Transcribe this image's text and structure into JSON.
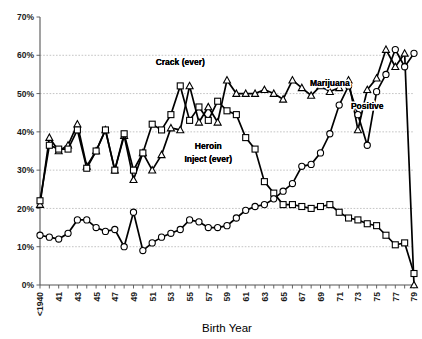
{
  "chart_data": {
    "type": "line",
    "title": "",
    "subtitle": "",
    "xlabel": "Birth Year",
    "ylabel": "",
    "ylim": [
      0,
      70
    ],
    "ytick_labels": [
      "0%",
      "10%",
      "20%",
      "30%",
      "40%",
      "50%",
      "60%",
      "70%"
    ],
    "ytick_values": [
      0,
      10,
      20,
      30,
      40,
      50,
      60,
      70
    ],
    "grid": "horizontal dashed gridlines at every 10% from 10% to 60%",
    "legend_position": "inline annotations on plot",
    "x": [
      "<1940",
      "1941",
      "1942",
      "1943",
      "1944",
      "1945",
      "1946",
      "1947",
      "1948",
      "1949",
      "1950",
      "1951",
      "1952",
      "1953",
      "1954",
      "1955",
      "1956",
      "1957",
      "1958",
      "1959",
      "1960",
      "1961",
      "1962",
      "1963",
      "1964",
      "1965",
      "1966",
      "1967",
      "1968",
      "1969",
      "1970",
      "1971",
      "1972",
      "1973",
      "1974",
      "1975",
      "1976",
      "1977",
      "1978",
      "1979",
      "1980"
    ],
    "xtick_labels": [
      "<1940",
      "41",
      "43",
      "45",
      "47",
      "49",
      "51",
      "53",
      "55",
      "57",
      "59",
      "61",
      "63",
      "65",
      "67",
      "69",
      "71",
      "73",
      "75",
      "77",
      "79"
    ],
    "xtick_label_every": 2,
    "annotations": [
      {
        "text": "Crack (ever)",
        "x_year": "1955",
        "y_pct": 57.5
      },
      {
        "text": "Heroin",
        "x_year": "1958",
        "y_pct": 35.5
      },
      {
        "text": "Inject (ever)",
        "x_year": "1958",
        "y_pct": 32.0
      },
      {
        "text": "Marijuana",
        "x_year": "1971",
        "y_pct": 52.0
      },
      {
        "text": "Positive",
        "x_year": "1975",
        "y_pct": 46.0
      }
    ],
    "series": [
      {
        "name": "Crack (ever)",
        "marker": "triangle",
        "values": [
          21.0,
          38.5,
          35.0,
          36.5,
          42.0,
          31.0,
          35.0,
          40.5,
          30.0,
          39.0,
          27.5,
          34.5,
          30.0,
          34.0,
          41.0,
          40.5,
          52.0,
          42.5,
          46.5,
          42.5,
          53.5,
          50.0,
          50.0,
          50.0,
          51.0,
          50.0,
          48.5,
          53.5,
          51.5,
          49.5,
          52.0,
          50.5,
          51.5,
          53.5,
          40.5,
          51.0,
          54.0,
          61.5,
          57.0,
          60.5,
          0.0
        ]
      },
      {
        "name": "Heroin Inject (ever)",
        "marker": "square",
        "values": [
          22.0,
          36.5,
          35.5,
          35.5,
          40.5,
          30.5,
          35.0,
          40.5,
          30.0,
          39.5,
          30.0,
          34.5,
          42.0,
          40.5,
          44.5,
          52.0,
          43.0,
          46.5,
          43.0,
          48.0,
          45.5,
          44.5,
          38.5,
          35.5,
          27.0,
          24.0,
          21.0,
          21.0,
          20.5,
          20.0,
          20.5,
          21.0,
          19.0,
          17.5,
          17.0,
          16.0,
          15.5,
          13.0,
          10.5,
          11.0,
          3.0
        ]
      },
      {
        "name": "Marijuana Positive",
        "marker": "circle",
        "values": [
          13.0,
          12.5,
          12.0,
          13.5,
          17.0,
          17.0,
          15.0,
          14.0,
          14.5,
          10.0,
          19.0,
          9.0,
          11.0,
          12.5,
          13.5,
          14.5,
          17.0,
          16.5,
          15.0,
          15.0,
          15.5,
          17.5,
          19.5,
          20.5,
          21.0,
          22.5,
          24.5,
          26.5,
          31.0,
          31.5,
          34.5,
          39.5,
          47.0,
          52.0,
          44.5,
          36.5,
          50.5,
          55.0,
          61.5,
          57.0,
          60.5
        ]
      }
    ]
  }
}
